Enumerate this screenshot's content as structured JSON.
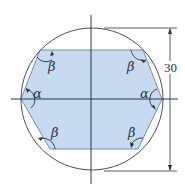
{
  "figure": {
    "colors": {
      "fill": "#c7daf0",
      "fill_edge": "#6f8fb8",
      "line": "#2a3340",
      "circle": "#4a4f57"
    },
    "angle_labels": {
      "top_left": "β",
      "top_right": "β",
      "left": "α",
      "right": "α",
      "bottom_left": "β",
      "bottom_right": "β"
    },
    "dimension": {
      "value": "30"
    }
  }
}
